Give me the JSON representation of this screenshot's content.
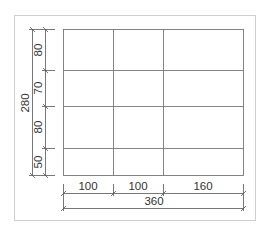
{
  "diagram": {
    "type": "dimensioned-grid",
    "columns": [
      {
        "label": "100",
        "value": 100
      },
      {
        "label": "100",
        "value": 100
      },
      {
        "label": "160",
        "value": 160
      }
    ],
    "total_width": {
      "label": "360",
      "value": 360
    },
    "rows": [
      {
        "label": "80",
        "value": 80
      },
      {
        "label": "70",
        "value": 70
      },
      {
        "label": "80",
        "value": 80
      },
      {
        "label": "50",
        "value": 50
      }
    ],
    "total_height": {
      "label": "280",
      "value": 280
    },
    "colors": {
      "frame": "#cfcfcf",
      "grid": "#777777",
      "dim_line": "#555555",
      "text": "#333333"
    }
  }
}
